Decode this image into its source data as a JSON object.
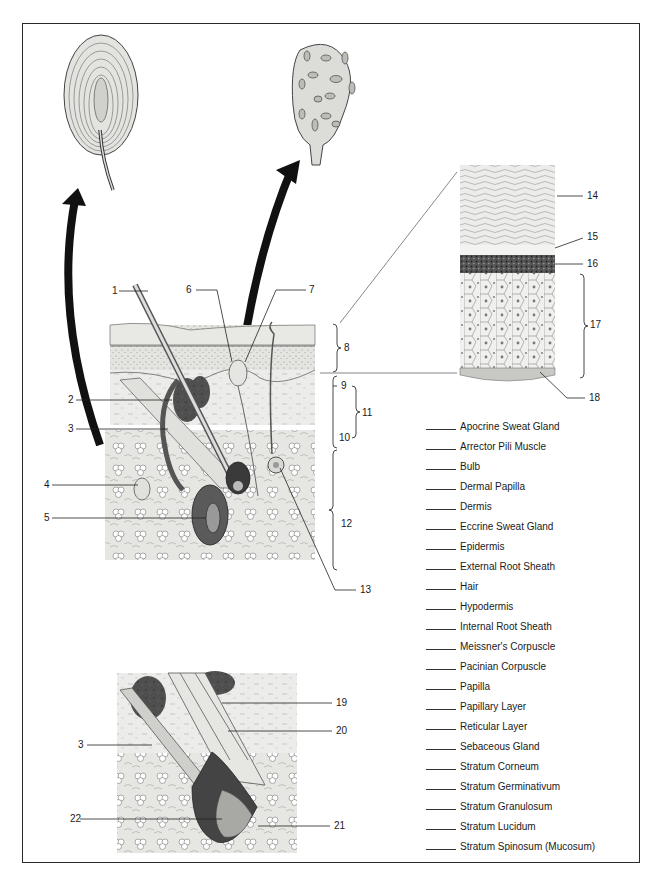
{
  "figure": {
    "insets": [
      {
        "name": "pacinian-corpuscle-detail"
      },
      {
        "name": "meissner-corpuscle-detail"
      },
      {
        "name": "epidermis-layers-detail"
      },
      {
        "name": "hair-follicle-bulb-detail"
      }
    ]
  },
  "callouts": {
    "n1": "1",
    "n2": "2",
    "n3": "3",
    "n4": "4",
    "n5": "5",
    "n6": "6",
    "n7": "7",
    "n8": "8",
    "n9": "9",
    "n10": "10",
    "n11": "11",
    "n12": "12",
    "n13": "13",
    "n14": "14",
    "n15": "15",
    "n16": "16",
    "n17": "17",
    "n18": "18",
    "n19": "19",
    "n20": "20",
    "n21": "21",
    "n22": "22",
    "n3b": "3"
  },
  "answer_list": {
    "items": [
      "Apocrine Sweat Gland",
      "Arrector Pili Muscle",
      "Bulb",
      "Dermal Papilla",
      "Dermis",
      "Eccrine Sweat Gland",
      "Epidermis",
      "External Root Sheath",
      "Hair",
      "Hypodermis",
      "Internal Root Sheath",
      "Meissner's Corpuscle",
      "Pacinian Corpuscle",
      "Papilla",
      "Papillary Layer",
      "Reticular Layer",
      "Sebaceous Gland",
      "Stratum Corneum",
      "Stratum Germinativum",
      "Stratum Granulosum",
      "Stratum Lucidum",
      "Stratum Spinosum (Mucosum)"
    ]
  },
  "colors": {
    "ink": "#1a1a1a",
    "tissue_light": "#e9e9e6",
    "tissue_mid": "#d6d6d2",
    "gland_dark": "#4a4a4a",
    "frame": "#2a2a2a"
  }
}
